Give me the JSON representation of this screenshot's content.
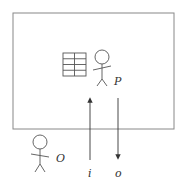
{
  "diagram": {
    "room": {
      "label": ""
    },
    "person_inside": {
      "label": "P"
    },
    "person_outside": {
      "label": "O"
    },
    "input_arrow": {
      "label": "i",
      "direction": "up"
    },
    "output_arrow": {
      "label": "o",
      "direction": "down"
    },
    "rulebook": {
      "rows": 4,
      "cols": 2
    },
    "colors": {
      "stroke": "#555555",
      "box": "#888888"
    }
  }
}
